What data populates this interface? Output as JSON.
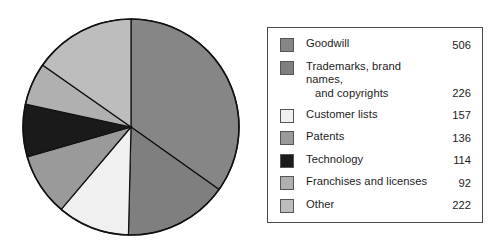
{
  "chart_data": {
    "type": "pie",
    "title": "",
    "unit": "",
    "total": 1453,
    "start_angle_deg": 0,
    "direction": "clockwise",
    "legend_position": "right",
    "categories": [
      "Goodwill",
      "Trademarks, brand names, and copyrights",
      "Customer lists",
      "Patents",
      "Technology",
      "Franchises and licenses",
      "Other"
    ],
    "values": [
      506,
      226,
      157,
      136,
      114,
      92,
      222
    ],
    "colors": [
      "#868686",
      "#7f7f7f",
      "#f0f0f0",
      "#9a9a9a",
      "#1a1a1a",
      "#b0b0b0",
      "#bdbdbd"
    ]
  },
  "legend": {
    "items": [
      {
        "label": "Goodwill",
        "label_line2": "",
        "value": "506",
        "color": "#868686"
      },
      {
        "label": "Trademarks, brand names,",
        "label_line2": "and copyrights",
        "value": "226",
        "color": "#7f7f7f"
      },
      {
        "label": "Customer lists",
        "label_line2": "",
        "value": "157",
        "color": "#f0f0f0"
      },
      {
        "label": "Patents",
        "label_line2": "",
        "value": "136",
        "color": "#9a9a9a"
      },
      {
        "label": "Technology",
        "label_line2": "",
        "value": "114",
        "color": "#1a1a1a"
      },
      {
        "label": "Franchises and licenses",
        "label_line2": "",
        "value": "92",
        "color": "#b0b0b0"
      },
      {
        "label": "Other",
        "label_line2": "",
        "value": "222",
        "color": "#bdbdbd"
      }
    ]
  }
}
